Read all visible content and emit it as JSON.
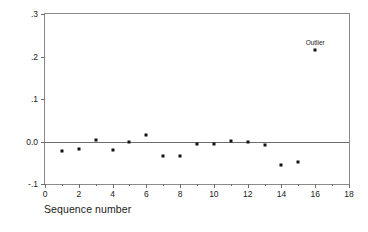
{
  "chart_data": {
    "type": "scatter",
    "title": "",
    "xlabel": "Sequence number",
    "ylabel": "Change in slope",
    "xlim": [
      0,
      18
    ],
    "ylim": [
      -0.1,
      0.3
    ],
    "grid": false,
    "legend": null,
    "x_ticks": [
      0,
      2,
      4,
      6,
      8,
      10,
      12,
      14,
      16,
      18
    ],
    "x_tick_labels": [
      "0",
      "2",
      "4",
      "6",
      "8",
      "10",
      "12",
      "14",
      "16",
      "18"
    ],
    "x_minor_ticks": [
      1,
      3,
      5,
      7,
      9,
      11,
      13,
      15,
      17
    ],
    "y_ticks": [
      -0.1,
      0.0,
      0.1,
      0.2,
      0.3
    ],
    "y_tick_labels": [
      "-.1",
      "0.0",
      ".1",
      ".2",
      ".3"
    ],
    "reference_lines": [
      {
        "axis": "y",
        "value": 0.0,
        "label": "zero-line"
      }
    ],
    "x": [
      1,
      2,
      3,
      4,
      5,
      6,
      7,
      8,
      9,
      10,
      11,
      12,
      13,
      14,
      15,
      16
    ],
    "y": [
      -0.022,
      -0.017,
      0.003,
      -0.019,
      -0.002,
      0.015,
      -0.034,
      -0.033,
      -0.006,
      -0.007,
      0.001,
      -0.001,
      -0.008,
      -0.055,
      -0.048,
      0.216
    ],
    "annotations": [
      {
        "text": "Outlier",
        "x": 16,
        "y": 0.216
      }
    ]
  }
}
